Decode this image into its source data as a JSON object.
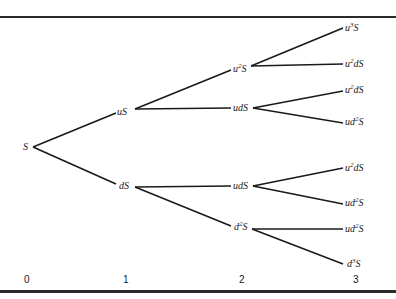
{
  "diagram": {
    "type": "binomial-tree",
    "line_color": "#1a1a1a",
    "steps": [
      "0",
      "1",
      "2",
      "3"
    ],
    "nodes": {
      "n0": {
        "base": "",
        "sup": "",
        "rest": "S",
        "x": 24,
        "y": 142
      },
      "n1u": {
        "base": "u",
        "sup": "",
        "rest": "S",
        "x": 118,
        "y": 107
      },
      "n1d": {
        "base": "d",
        "sup": "",
        "rest": "S",
        "x": 120,
        "y": 180
      },
      "n2uu": {
        "base": "u",
        "sup": "2",
        "rest": "S",
        "x": 233,
        "y": 64
      },
      "n2ud_a": {
        "base": "ud",
        "sup": "",
        "rest": "S",
        "x": 233,
        "y": 103
      },
      "n2ud_b": {
        "base": "ud",
        "sup": "",
        "rest": "S",
        "x": 233,
        "y": 180
      },
      "n2dd": {
        "base": "d",
        "sup": "2",
        "rest": "S",
        "x": 235,
        "y": 223
      },
      "n3_1": {
        "base": "u",
        "sup": "3",
        "rest": "S",
        "x": 346,
        "y": 23
      },
      "n3_2": {
        "base": "u",
        "sup": "2",
        "rest": "dS",
        "x": 346,
        "y": 59
      },
      "n3_3": {
        "base": "u",
        "sup": "2",
        "rest": "dS",
        "x": 346,
        "y": 85
      },
      "n3_4": {
        "base": "ud",
        "sup": "2",
        "rest": "S",
        "x": 346,
        "y": 117
      },
      "n3_5": {
        "base": "u",
        "sup": "2",
        "rest": "dS",
        "x": 346,
        "y": 163
      },
      "n3_6": {
        "base": "ud",
        "sup": "2",
        "rest": "S",
        "x": 346,
        "y": 198
      },
      "n3_7": {
        "base": "ud",
        "sup": "2",
        "rest": "S",
        "x": 346,
        "y": 224
      },
      "n3_8": {
        "base": "d",
        "sup": "3",
        "rest": "S",
        "x": 348,
        "y": 260
      }
    }
  }
}
